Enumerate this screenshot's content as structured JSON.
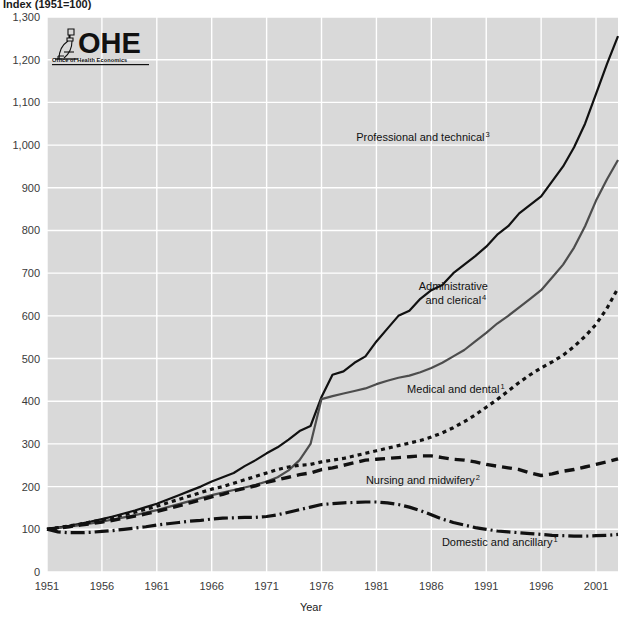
{
  "chart_data": {
    "type": "line",
    "title": "Index (1951=100)",
    "xlabel": "Year",
    "ylabel": "",
    "xlim": [
      1951,
      2003
    ],
    "ylim": [
      0,
      1300
    ],
    "ytick_step": 100,
    "xtick_step": 5,
    "grid": true,
    "legend_position": "inline-annotations",
    "plot_background": "#d9d9d9",
    "gridline_color": "#ffffff",
    "yticks": [
      "0",
      "100",
      "200",
      "300",
      "400",
      "500",
      "600",
      "700",
      "800",
      "900",
      "1,000",
      "1,100",
      "1,200",
      "1,300"
    ],
    "xticks": [
      "1951",
      "1956",
      "1961",
      "1966",
      "1971",
      "1976",
      "1981",
      "1986",
      "1991",
      "1996",
      "2001"
    ],
    "x": [
      1951,
      1952,
      1953,
      1954,
      1955,
      1956,
      1957,
      1958,
      1959,
      1960,
      1961,
      1962,
      1963,
      1964,
      1965,
      1966,
      1967,
      1968,
      1969,
      1970,
      1971,
      1972,
      1973,
      1974,
      1975,
      1976,
      1977,
      1978,
      1979,
      1980,
      1981,
      1982,
      1983,
      1984,
      1985,
      1986,
      1987,
      1988,
      1989,
      1990,
      1991,
      1992,
      1993,
      1994,
      1995,
      1996,
      1997,
      1998,
      1999,
      2000,
      2001,
      2002,
      2003
    ],
    "series": [
      {
        "name": "Professional and technical",
        "footnote": "3",
        "color": "#111111",
        "dash": "none",
        "width": 2.2,
        "label_x": 1985,
        "label_y": 1010,
        "values": [
          100,
          104,
          108,
          113,
          118,
          124,
          130,
          137,
          144,
          152,
          160,
          170,
          180,
          190,
          200,
          212,
          222,
          232,
          248,
          262,
          278,
          292,
          310,
          330,
          342,
          410,
          462,
          470,
          490,
          505,
          540,
          570,
          600,
          612,
          640,
          660,
          672,
          700,
          720,
          740,
          762,
          790,
          810,
          840,
          860,
          880,
          915,
          950,
          995,
          1050,
          1120,
          1190,
          1255
        ]
      },
      {
        "name": "Administrative and clerical",
        "footnote": "4",
        "color": "#4d4d4d",
        "dash": "none",
        "width": 2.2,
        "label_x": 1988,
        "label_y": 660,
        "values": [
          100,
          103,
          106,
          110,
          114,
          118,
          123,
          128,
          133,
          139,
          145,
          152,
          159,
          166,
          173,
          180,
          186,
          192,
          198,
          204,
          212,
          222,
          238,
          262,
          300,
          405,
          412,
          418,
          424,
          430,
          440,
          448,
          455,
          460,
          468,
          478,
          490,
          505,
          520,
          540,
          560,
          582,
          600,
          620,
          640,
          660,
          690,
          720,
          760,
          810,
          870,
          920,
          965
        ]
      },
      {
        "name": "Medical and dental",
        "footnote": "1",
        "color": "#111111",
        "dash": "4,4",
        "width": 3.2,
        "label_x": 1988,
        "label_y": 420,
        "values": [
          100,
          104,
          108,
          112,
          117,
          122,
          128,
          134,
          140,
          147,
          154,
          162,
          170,
          178,
          186,
          194,
          200,
          208,
          216,
          224,
          232,
          240,
          246,
          250,
          252,
          258,
          262,
          266,
          272,
          278,
          284,
          290,
          296,
          302,
          308,
          316,
          326,
          338,
          352,
          368,
          386,
          404,
          424,
          444,
          462,
          478,
          492,
          508,
          528,
          552,
          580,
          618,
          665
        ]
      },
      {
        "name": "Nursing and midwifery",
        "footnote": "2",
        "color": "#111111",
        "dash": "10,6",
        "width": 3.4,
        "label_x": 1985,
        "label_y": 206,
        "values": [
          100,
          103,
          106,
          110,
          113,
          117,
          121,
          126,
          131,
          136,
          142,
          148,
          155,
          162,
          169,
          176,
          182,
          190,
          196,
          202,
          210,
          216,
          222,
          228,
          232,
          240,
          244,
          250,
          256,
          262,
          264,
          266,
          268,
          270,
          272,
          272,
          268,
          264,
          262,
          258,
          252,
          248,
          244,
          240,
          232,
          226,
          230,
          236,
          240,
          246,
          252,
          258,
          265
        ]
      },
      {
        "name": "Domestic and ancillary",
        "footnote": "1",
        "color": "#111111",
        "dash": "14,4,2,4",
        "width": 3.2,
        "label_x": 1992,
        "label_y": 60,
        "values": [
          100,
          94,
          92,
          92,
          93,
          95,
          97,
          100,
          103,
          106,
          110,
          113,
          116,
          119,
          121,
          124,
          126,
          127,
          128,
          128,
          130,
          134,
          140,
          146,
          152,
          158,
          160,
          162,
          163,
          164,
          164,
          162,
          158,
          152,
          144,
          134,
          124,
          116,
          110,
          104,
          100,
          96,
          94,
          92,
          90,
          88,
          86,
          85,
          84,
          84,
          85,
          86,
          88
        ]
      }
    ]
  },
  "logo": {
    "name": "OHE",
    "subtitle": "Office of Health Economics",
    "icon": "microscope-icon"
  }
}
